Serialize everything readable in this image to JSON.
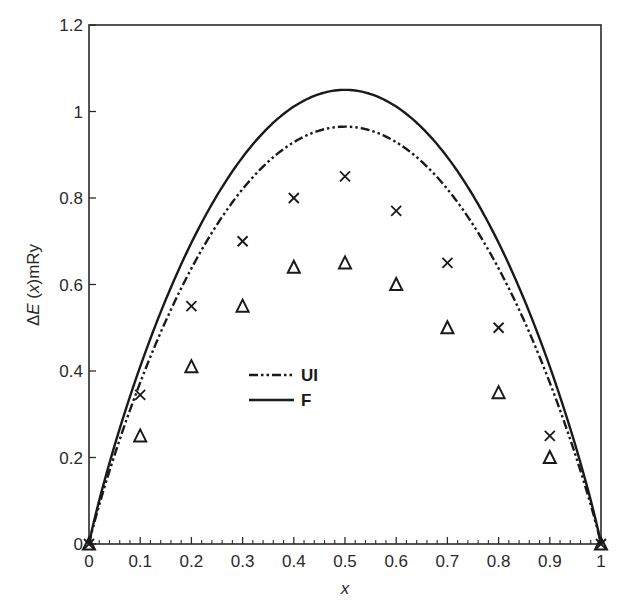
{
  "chart_data": {
    "type": "line",
    "title": "",
    "xlabel": "x",
    "ylabel": "ΔE (x)mRy",
    "xlim": [
      0,
      1
    ],
    "ylim": [
      0,
      1.2
    ],
    "grid": false,
    "legend_position": "center-left (inside plot, ~x=0.3, y=0.4)",
    "x_ticks": [
      "0",
      "0.1",
      "0.2",
      "0.3",
      "0.4",
      "0.5",
      "0.6",
      "0.7",
      "0.8",
      "0.9",
      "1"
    ],
    "y_ticks": [
      "0",
      "0.2",
      "0.4",
      "0.6",
      "0.8",
      "1",
      "1.2"
    ],
    "series": [
      {
        "name": "UI",
        "kind": "curve",
        "style": "dash-dot-dot",
        "color": "#1a1a1a",
        "peak": {
          "x": 0.5,
          "y": 0.965
        },
        "x": [
          0,
          0.1,
          0.2,
          0.3,
          0.4,
          0.5,
          0.6,
          0.7,
          0.8,
          0.9,
          1
        ],
        "values": [
          0,
          0.37,
          0.64,
          0.83,
          0.93,
          0.965,
          0.93,
          0.83,
          0.64,
          0.37,
          0
        ]
      },
      {
        "name": "F",
        "kind": "curve",
        "style": "solid",
        "color": "#1a1a1a",
        "peak": {
          "x": 0.5,
          "y": 1.05
        },
        "x": [
          0,
          0.1,
          0.2,
          0.3,
          0.4,
          0.5,
          0.6,
          0.7,
          0.8,
          0.9,
          1
        ],
        "values": [
          0,
          0.41,
          0.7,
          0.9,
          1.01,
          1.05,
          1.01,
          0.9,
          0.7,
          0.41,
          0
        ]
      },
      {
        "name": "cross markers",
        "kind": "scatter",
        "marker": "x",
        "color": "#1a1a1a",
        "x": [
          0,
          0.1,
          0.2,
          0.3,
          0.4,
          0.5,
          0.6,
          0.7,
          0.8,
          0.9,
          1
        ],
        "values": [
          0,
          0.345,
          0.55,
          0.7,
          0.8,
          0.85,
          0.77,
          0.65,
          0.5,
          0.25,
          0
        ]
      },
      {
        "name": "triangle markers",
        "kind": "scatter",
        "marker": "triangle",
        "color": "#1a1a1a",
        "x": [
          0,
          0.1,
          0.2,
          0.3,
          0.4,
          0.5,
          0.6,
          0.7,
          0.8,
          0.9,
          1
        ],
        "values": [
          0,
          0.25,
          0.41,
          0.55,
          0.64,
          0.65,
          0.6,
          0.5,
          0.35,
          0.2,
          0
        ]
      }
    ],
    "legend": [
      {
        "label": "UI",
        "style": "dash-dot-dot"
      },
      {
        "label": "F",
        "style": "solid"
      }
    ]
  },
  "labels": {
    "xlabel": "x",
    "ylabel_delta": "Δ",
    "ylabel_E": "E",
    "ylabel_rest1": " (",
    "ylabel_x": "x",
    "ylabel_rest2": ")mRy",
    "legend_ui": "UI",
    "legend_f": "F"
  }
}
